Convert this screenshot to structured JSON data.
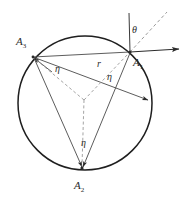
{
  "figure": {
    "type": "geometry-diagram",
    "colors": {
      "stroke": "#2b2b2b",
      "circle": "#1f1f1f",
      "dashed": "#8a8a8a",
      "background": "#ffffff",
      "text": "#2b2b2b"
    },
    "circle": {
      "cx": 85,
      "cy": 103,
      "r": 67
    },
    "center": {
      "cx": 84,
      "cy": 100
    },
    "points": [
      {
        "id": "A1",
        "label": "A",
        "sub": "1",
        "x": 130,
        "y": 52,
        "label_x": 133,
        "label_y": 57
      },
      {
        "id": "A2",
        "label": "A",
        "sub": "2",
        "x": 82,
        "y": 168,
        "label_x": 74,
        "label_y": 180
      },
      {
        "id": "A3",
        "label": "A",
        "sub": "3",
        "x": 33,
        "y": 57,
        "label_x": 16,
        "label_y": 36
      }
    ],
    "angle_labels": [
      {
        "id": "eta-at-A3",
        "text": "η",
        "x": 55,
        "y": 64
      },
      {
        "id": "eta-at-A1",
        "text": "η",
        "x": 107,
        "y": 72
      },
      {
        "id": "eta-at-A2",
        "text": "η",
        "x": 81,
        "y": 138
      }
    ],
    "radius_label": {
      "id": "r",
      "text": "r",
      "x": 97,
      "y": 59
    },
    "theta_label": {
      "id": "theta",
      "text": "θ",
      "x": 132,
      "y": 25
    },
    "rays_at_A1": {
      "vertical_line": {
        "x1": 129,
        "y1": 13,
        "x2": 130,
        "y2": 52
      },
      "dashed_ray": {
        "x1": 130,
        "y1": 52,
        "x2": 167,
        "y2": 12
      },
      "horizontal_arrow": {
        "x1": 130,
        "y1": 52,
        "x2": 180,
        "y2": 49
      }
    },
    "radius_arrow_end": {
      "x": 149,
      "y": 101
    }
  }
}
